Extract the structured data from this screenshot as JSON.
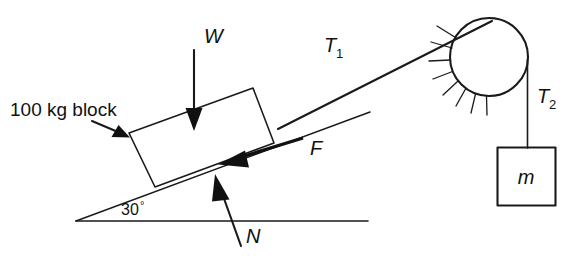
{
  "figure": {
    "kind": "free-body-diagram",
    "title_visible": false,
    "background_color": "#ffffff",
    "ink_color": "#111111"
  },
  "labels": {
    "block_mass": "100 kg block",
    "weight": "W",
    "tension_incline_base": "T",
    "tension_incline_sub": "1",
    "tension_hanging_base": "T",
    "tension_hanging_sub": "2",
    "friction": "F",
    "normal": "N",
    "hanging_mass": "m",
    "incline_angle": "30",
    "incline_angle_degree_symbol": "°"
  },
  "geometry": {
    "incline_angle_degrees": 30,
    "ground_line": {
      "x1": 76,
      "y1": 221,
      "x2": 368,
      "y2": 221
    },
    "incline_line": {
      "x1": 76,
      "y1": 221,
      "x2": 370,
      "y2": 112
    },
    "rope_upper": {
      "x1": 281,
      "y1": 128,
      "x2": 492,
      "y2": 22
    },
    "block_corners": [
      {
        "x": 129,
        "y": 133
      },
      {
        "x": 253,
        "y": 88
      },
      {
        "x": 274,
        "y": 143
      },
      {
        "x": 155,
        "y": 187
      }
    ],
    "pulley": {
      "cx": 489,
      "cy": 57,
      "r": 39
    },
    "hanging_rope": {
      "x1": 527,
      "y1": 62,
      "x2": 527,
      "y2": 147
    },
    "hanging_block": {
      "x": 497,
      "y": 147,
      "w": 58,
      "h": 58
    }
  },
  "arrows": [
    {
      "name": "weight-arrow",
      "label": "W",
      "x1": 194,
      "y1": 50,
      "x2": 194,
      "y2": 127,
      "direction": "down"
    },
    {
      "name": "friction-arrow",
      "label": "F",
      "x1": 302,
      "y1": 139,
      "x2": 218,
      "y2": 165,
      "direction": "down-left"
    },
    {
      "name": "normal-arrow",
      "label": "N",
      "x1": 241,
      "y1": 246,
      "x2": 215,
      "y2": 174,
      "direction": "up-left"
    },
    {
      "name": "block-callout-arrow",
      "label": "100 kg block",
      "x1": 92,
      "y1": 121,
      "x2": 128,
      "y2": 137,
      "direction": "down-right"
    }
  ],
  "label_positions": {
    "block_mass": {
      "x": 10,
      "y": 116
    },
    "weight": {
      "x": 204,
      "y": 43
    },
    "tension_1": {
      "x": 324,
      "y": 52
    },
    "tension_2": {
      "x": 537,
      "y": 103
    },
    "friction": {
      "x": 310,
      "y": 155
    },
    "normal": {
      "x": 246,
      "y": 243
    },
    "hanging_mass": {
      "x": 526,
      "y": 183
    },
    "incline_angle": {
      "x": 121,
      "y": 215
    }
  },
  "pulley_support": {
    "hatch_count": 8,
    "arc_start_degrees": 150,
    "arc_end_degrees": 265
  }
}
